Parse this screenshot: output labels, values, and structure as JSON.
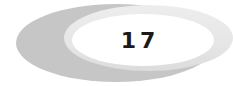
{
  "badge": {
    "number": "17",
    "colors": {
      "outer": "#c6c6c6",
      "crescent": "#e8e8e8",
      "inner": "#ffffff",
      "text": "#1a1a1a"
    }
  }
}
